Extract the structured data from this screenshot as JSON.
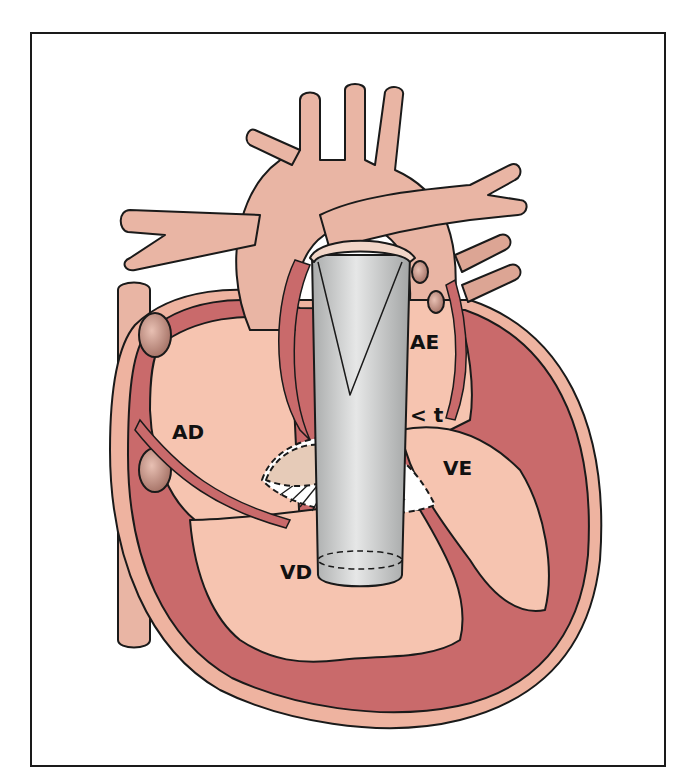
{
  "diagram": {
    "labels": {
      "right_atrium": "AD",
      "left_atrium": "AE",
      "right_ventricle": "VD",
      "left_ventricle": "VE",
      "marker": "< t"
    },
    "colors": {
      "vessel": "#e9b5a4",
      "vessel_dark": "#dca594",
      "chamber": "#f6c4b0",
      "myocardium": "#c96a6b",
      "epicardium": "#eeb3a0",
      "device_gray": "#c8c9c9",
      "outline": "#1a1a1a",
      "frame": "#1a1a1a"
    }
  }
}
